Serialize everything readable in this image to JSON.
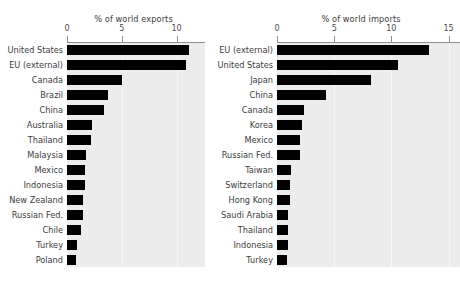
{
  "figure": {
    "background_color": "#ffffff",
    "plot_background_color": "#ececec",
    "bar_color": "#000000",
    "grid_color": "#f7f7f7",
    "axis_color": "#8d8d8d"
  },
  "panels": {
    "exports": {
      "axis_title": "% of world exports",
      "tick_labels": [
        "0",
        "5",
        "10"
      ],
      "tick_values": [
        0,
        5,
        10
      ]
    },
    "imports": {
      "axis_title": "% of world imports",
      "tick_labels": [
        "0",
        "5",
        "10",
        "15"
      ],
      "tick_values": [
        0,
        5,
        10,
        15
      ]
    }
  },
  "chart_data": [
    {
      "type": "bar",
      "orientation": "horizontal",
      "title": "% of world exports",
      "xlabel": "% of world exports",
      "ylabel": "",
      "xlim": [
        0,
        12.6
      ],
      "xticks": [
        0,
        5,
        10
      ],
      "grid": true,
      "legend": "none",
      "categories": [
        "United States",
        "EU (external)",
        "Canada",
        "Brazil",
        "China",
        "Australia",
        "Thailand",
        "Malaysia",
        "Mexico",
        "Indonesia",
        "New Zealand",
        "Russian Fed.",
        "Chile",
        "Turkey",
        "Poland"
      ],
      "values": [
        11.1,
        10.9,
        5.0,
        3.7,
        3.4,
        2.3,
        2.2,
        1.7,
        1.6,
        1.6,
        1.5,
        1.5,
        1.3,
        0.9,
        0.85
      ]
    },
    {
      "type": "bar",
      "orientation": "horizontal",
      "title": "% of world imports",
      "xlabel": "% of world imports",
      "ylabel": "",
      "xlim": [
        0,
        16.0
      ],
      "xticks": [
        0,
        5,
        10,
        15
      ],
      "grid": true,
      "legend": "none",
      "categories": [
        "EU (external)",
        "United States",
        "Japan",
        "China",
        "Canada",
        "Korea",
        "Mexico",
        "Russian Fed.",
        "Taiwan",
        "Switzerland",
        "Hong Kong",
        "Saudi Arabia",
        "Thailand",
        "Indonesia",
        "Turkey"
      ],
      "values": [
        13.3,
        10.6,
        8.2,
        4.3,
        2.4,
        2.2,
        2.0,
        2.0,
        1.2,
        1.1,
        1.1,
        1.0,
        1.0,
        0.95,
        0.9
      ]
    }
  ]
}
